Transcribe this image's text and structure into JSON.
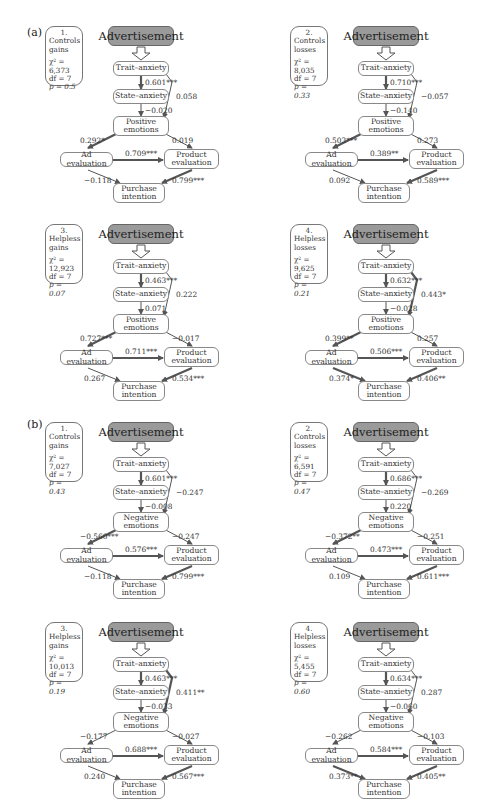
{
  "figure": {
    "section_labels": [
      "(a)",
      "(b)"
    ],
    "node_labels": {
      "advertisement": "Advertisement",
      "trait_anxiety": "Trait–anxiety",
      "state_anxiety": "State–anxiety",
      "purchase_intention_1": "Purchase",
      "purchase_intention_2": "intention",
      "ad_evaluation": "Ad evaluation",
      "product_evaluation_1": "Product",
      "product_evaluation_2": "evaluation"
    },
    "panels": [
      {
        "section": "a",
        "number": "1.",
        "group_1": "Controls",
        "group_2": "gains",
        "chi2": "χ² = 6,373",
        "df": "df = 7",
        "p": "p = 0.5",
        "emotion_1": "Positive",
        "emotion_2": "emotions",
        "trait_state": "0.601***",
        "state_emotion": "−0.020",
        "trait_emotion": "0.058",
        "emotion_ad": "0.292*",
        "emotion_product": "0.019",
        "ad_product": "0.709***",
        "ad_purchase": "−0.118",
        "product_purchase": "0.799***"
      },
      {
        "section": "a",
        "number": "2.",
        "group_1": "Controls",
        "group_2": "losses",
        "chi2": "χ² = 8,035",
        "df": "df = 7",
        "p": "p = 0.33",
        "emotion_1": "Positive",
        "emotion_2": "emotions",
        "trait_state": "0.710***",
        "state_emotion": "−0.140",
        "trait_emotion": "−0.057",
        "emotion_ad": "0.503***",
        "emotion_product": "0.273",
        "ad_product": "0.389**",
        "ad_purchase": "0.092",
        "product_purchase": "0.589***"
      },
      {
        "section": "a",
        "number": "3.",
        "group_1": "Helpless",
        "group_2": "gains",
        "chi2": "χ² = 12,923",
        "df": "df = 7",
        "p": "p = 0.07",
        "emotion_1": "Positive",
        "emotion_2": "emotions",
        "trait_state": "0.463***",
        "state_emotion": "0.071",
        "trait_emotion": "0.222",
        "emotion_ad": "0.727***",
        "emotion_product": "−0.017",
        "ad_product": "0.711***",
        "ad_purchase": "0.267",
        "product_purchase": "0.534***"
      },
      {
        "section": "a",
        "number": "4.",
        "group_1": "Helpless",
        "group_2": "losses",
        "chi2": "χ² = 9,625",
        "df": "df = 7",
        "p": "p = 0.21",
        "emotion_1": "Positive",
        "emotion_2": "emotions",
        "trait_state": "0.632***",
        "state_emotion": "−0.028",
        "trait_emotion": "0.443*",
        "emotion_ad": "0.399**",
        "emotion_product": "0.257",
        "ad_product": "0.506***",
        "ad_purchase": "0.374*",
        "product_purchase": "0.406**"
      },
      {
        "section": "b",
        "number": "1.",
        "group_1": "Controls",
        "group_2": "gains",
        "chi2": "χ² = 7,027",
        "df": "df = 7",
        "p": "p = 0.43",
        "emotion_1": "Negative",
        "emotion_2": "emotions",
        "trait_state": "0.601***",
        "state_emotion": "−0.008",
        "trait_emotion": "−0.247",
        "emotion_ad": "−0.560***",
        "emotion_product": "−0.247",
        "ad_product": "0.576***",
        "ad_purchase": "−0.118",
        "product_purchase": "0.799***"
      },
      {
        "section": "b",
        "number": "2.",
        "group_1": "Controls",
        "group_2": "losses",
        "chi2": "χ² = 6,591",
        "df": "df = 7",
        "p": "p = 0.47",
        "emotion_1": "Negative",
        "emotion_2": "emotions",
        "trait_state": "0.686***",
        "state_emotion": "0.220",
        "trait_emotion": "−0.269",
        "emotion_ad": "−0.372**",
        "emotion_product": "−0.251",
        "ad_product": "0.473***",
        "ad_purchase": "0.109",
        "product_purchase": "0.611***"
      },
      {
        "section": "b",
        "number": "3.",
        "group_1": "Helpless",
        "group_2": "gains",
        "chi2": "χ² = 10,013",
        "df": "df = 7",
        "p": "p = 0.19",
        "emotion_1": "Negative",
        "emotion_2": "emotions",
        "trait_state": "0.463***",
        "state_emotion": "−0.033",
        "trait_emotion": "0.411**",
        "emotion_ad": "−0.177",
        "emotion_product": "−0.027",
        "ad_product": "0.688***",
        "ad_purchase": "0.240",
        "product_purchase": "0.567***"
      },
      {
        "section": "b",
        "number": "4.",
        "group_1": "Helpless",
        "group_2": "losses",
        "chi2": "χ² = 5,455",
        "df": "df = 7",
        "p": "p = 0.60",
        "emotion_1": "Negative",
        "emotion_2": "emotions",
        "trait_state": "0.634***",
        "state_emotion": "−0.060",
        "trait_emotion": "0.287",
        "emotion_ad": "−0.262",
        "emotion_product": "−0.103",
        "ad_product": "0.584***",
        "ad_purchase": "0.373**",
        "product_purchase": "0.405**"
      }
    ]
  }
}
